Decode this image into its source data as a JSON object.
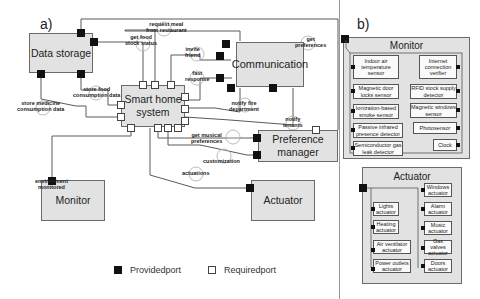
{
  "panels": {
    "a": {
      "label": "a)",
      "components": {
        "data_storage": "Data storage",
        "smart_home_system": "Smart home system",
        "communication": "Communication",
        "preference_manager": "Preference manager",
        "monitor": "Monitor",
        "actuator": "Actuator"
      },
      "interfaces": {
        "get_food_stock_status": "get food\nstock status",
        "request_meal": "request meal\nfrom restaurant",
        "invite_friend": "invite\nfriend",
        "fast_response": "fast\nresponse",
        "get_preferences": "get\npreferences",
        "store_food_consumption": "store food\nconsumption data",
        "store_medicine_consumption": "store medicine\nconsumption data",
        "notify_fire_department": "notify fire\ndepartment",
        "notify_tenants": "notify\ntenants",
        "get_musical_preferences": "get musical\npreferences",
        "customization": "customization",
        "actuations": "actuations",
        "environment_monitored": "environment\nmonitored"
      }
    },
    "b": {
      "label": "b)",
      "monitor": {
        "title": "Monitor",
        "left": [
          "Indoor air temperature sensor",
          "Magnetic door locks sensor",
          "Ionization-based smoke sensor",
          "Passive infrared presence detector",
          "Semiconductor gas leak detector"
        ],
        "right": [
          "Internet connection verifier",
          "RFID stock supply detector",
          "Magnetic windows sensor",
          "Photosensor",
          "Clock"
        ]
      },
      "actuator": {
        "title": "Actuator",
        "left": [
          "Lights actuator",
          "Heating actuator",
          "Air ventilator actuator",
          "Power outlets actuator"
        ],
        "right": [
          "Windows actuator",
          "Alarm actuator",
          "Music actuator",
          "Gas valves actuator",
          "Doors actuator"
        ]
      }
    }
  },
  "legend": {
    "provided": "Providedport",
    "required": "Requiredport"
  },
  "colors": {
    "component_fill": "#e2e2e2",
    "provided_port": "#111111",
    "required_port": "#ffffff",
    "line": "#555555"
  }
}
